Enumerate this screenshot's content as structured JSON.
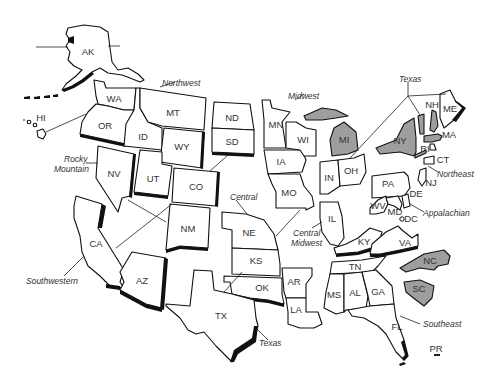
{
  "map": {
    "highlight_color": "#9e9e9e",
    "outline_color": "#111111",
    "background": "#ffffff",
    "states": {
      "AK": "AK",
      "HI": "HI",
      "WA": "WA",
      "OR": "OR",
      "ID": "ID",
      "MT": "MT",
      "WY": "WY",
      "NV": "NV",
      "UT": "UT",
      "CO": "CO",
      "CA": "CA",
      "AZ": "AZ",
      "NM": "NM",
      "ND": "ND",
      "SD": "SD",
      "NE": "NE",
      "KS": "KS",
      "OK": "OK",
      "TX": "TX",
      "MN": "MN",
      "IA": "IA",
      "MO": "MO",
      "AR": "AR",
      "LA": "LA",
      "WI": "WI",
      "IL": "IL",
      "MI": "MI",
      "IN": "IN",
      "OH": "OH",
      "KY": "KY",
      "TN": "TN",
      "MS": "MS",
      "AL": "AL",
      "GA": "GA",
      "FL": "FL",
      "PA": "PA",
      "NY": "NY",
      "WV": "WV",
      "MD": "MD",
      "DE": "DE",
      "NJ": "NJ",
      "DC": "DC",
      "VA": "VA",
      "NC": "NC",
      "SC": "SC",
      "NH": "NH",
      "ME": "ME",
      "MA": "MA",
      "RI": "RI",
      "CT": "CT",
      "PR": "PR"
    },
    "highlighted_states": [
      "MI",
      "NY",
      "VT",
      "NH",
      "MA",
      "NC",
      "SC"
    ],
    "regions": {
      "northwest": "Northwest",
      "rocky_mountain_line1": "Rocky",
      "rocky_mountain_line2": "Mountain",
      "southwestern": "Southwestern",
      "central": "Central",
      "texas_south": "Texas",
      "midwest": "Midwest",
      "central_midwest_line1": "Central",
      "central_midwest_line2": "Midwest",
      "texas_north": "Texas",
      "northeast": "Northeast",
      "appalachian": "Appalachian",
      "southeast": "Southeast"
    }
  }
}
